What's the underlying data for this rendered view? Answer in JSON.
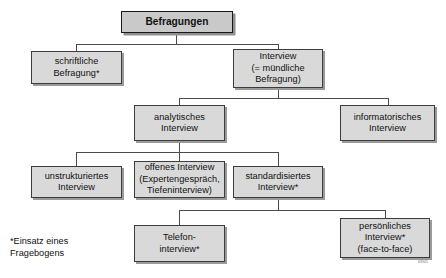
{
  "diagram": {
    "title": "Befragungen",
    "nodes": [
      {
        "id": "befragungen",
        "label": "Befragungen"
      },
      {
        "id": "schriftliche",
        "label": "schriftliche\nBefragung*"
      },
      {
        "id": "interview",
        "label": "Interview\n(= mündliche\nBefragung)"
      },
      {
        "id": "analytisches",
        "label": "analytisches\nInterview"
      },
      {
        "id": "informatorisches",
        "label": "informatorisches\nInterview"
      },
      {
        "id": "unstrukturiertes",
        "label": "unstrukturiertes\nInterview"
      },
      {
        "id": "offenes",
        "label": "offenes Interview\n(Expertengespräch,\nTiefeninterview)"
      },
      {
        "id": "standardisiertes",
        "label": "standardisiertes\nInterview*"
      },
      {
        "id": "telefon",
        "label": "Telefon-\ninterview*"
      },
      {
        "id": "persoenliches",
        "label": "persönliches\nInterview*\n(face-to-face)"
      }
    ],
    "footnote": "*Einsatz eines\nFragebogens",
    "plate_code": "63905",
    "colors": {
      "box_fill": "#d9d9d9",
      "root_fill": "#c9c9c9",
      "border": "#3c3c3c",
      "line": "#4a4a4a",
      "shadow": "#9a9a9a",
      "text": "#111111",
      "background": "#ffffff"
    }
  }
}
